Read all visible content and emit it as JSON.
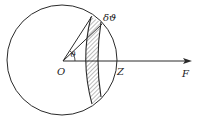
{
  "diagram": {
    "labels": {
      "origin": "O",
      "zenith": "Z",
      "force": "F",
      "angle": "ϑ",
      "delta_angle": "δϑ"
    },
    "colors": {
      "stroke": "#2a2a2a",
      "hatch": "#555555",
      "background": "#ffffff"
    },
    "geometry": {
      "circle_center": [
        62,
        60
      ],
      "circle_radius": 55,
      "axis_y": 61,
      "arrow_end_x": 192
    }
  }
}
